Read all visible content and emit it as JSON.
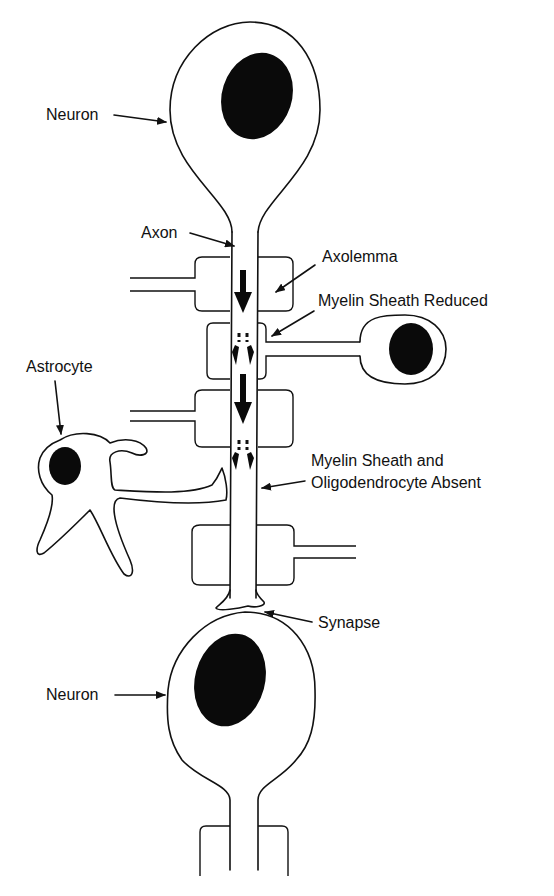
{
  "diagram": {
    "type": "neuron-myelination-schematic",
    "labels": {
      "neuron_top": "Neuron",
      "axon": "Axon",
      "axolemma": "Axolemma",
      "myelin_reduced": "Myelin Sheath Reduced",
      "astrocyte": "Astrocyte",
      "myelin_absent_line1": "Myelin Sheath and",
      "myelin_absent_line2": "Oligodendrocyte Absent",
      "synapse": "Synapse",
      "neuron_bottom": "Neuron"
    },
    "colors": {
      "ink": "#111111",
      "background": "#ffffff"
    }
  }
}
